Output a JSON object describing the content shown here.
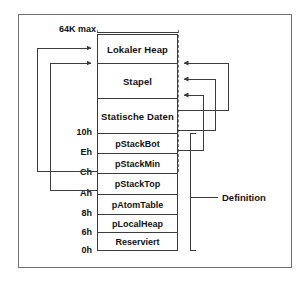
{
  "diagram": {
    "title_caption": "64K max",
    "definition_caption": "Definition",
    "segments": [
      {
        "id": "lokaler-heap",
        "label": "Lokaler Heap"
      },
      {
        "id": "stapel",
        "label": "Stapel"
      },
      {
        "id": "statische-daten",
        "label": "Statische Daten"
      },
      {
        "id": "pstackbot",
        "label": "pStackBot"
      },
      {
        "id": "pstackmin",
        "label": "pStackMin"
      },
      {
        "id": "pstacktop",
        "label": "pStackTop"
      },
      {
        "id": "patomtable",
        "label": "pAtomTable"
      },
      {
        "id": "plocalheap",
        "label": "pLocalHeap"
      },
      {
        "id": "reserviert",
        "label": "Reserviert"
      }
    ],
    "addresses": [
      {
        "id": "addr-10h",
        "label": "10h"
      },
      {
        "id": "addr-eh",
        "label": "Eh"
      },
      {
        "id": "addr-ch",
        "label": "Ch"
      },
      {
        "id": "addr-ah",
        "label": "Ah"
      },
      {
        "id": "addr-8h",
        "label": "8h"
      },
      {
        "id": "addr-6h",
        "label": "6h"
      },
      {
        "id": "addr-0h",
        "label": "0h"
      }
    ],
    "colors": {
      "frame": "#6f6f6f",
      "box_border": "#3d3d3d",
      "wire": "#3d3d3d",
      "text": "#111111",
      "background": "#ffffff"
    }
  }
}
